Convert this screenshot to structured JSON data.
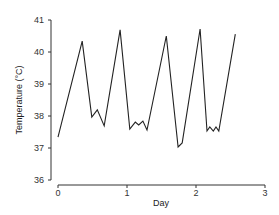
{
  "chart_data": {
    "type": "line",
    "title": "",
    "xlabel": "Day",
    "ylabel": "Temperature (°C)",
    "xlim": [
      0,
      3
    ],
    "ylim": [
      36,
      41
    ],
    "xticks": [
      "0",
      "1",
      "2",
      "3"
    ],
    "yticks": [
      "36",
      "37",
      "38",
      "39",
      "40",
      "41"
    ],
    "grid": false,
    "legend": null,
    "series": [
      {
        "name": "Temperature",
        "color": "#222222",
        "x": [
          0,
          0.35,
          0.49,
          0.57,
          0.67,
          0.9,
          1.04,
          1.12,
          1.17,
          1.23,
          1.29,
          1.57,
          1.74,
          1.8,
          2.06,
          2.16,
          2.2,
          2.25,
          2.29,
          2.33,
          2.57
        ],
        "y": [
          37.34,
          40.34,
          37.97,
          38.19,
          37.69,
          40.69,
          37.59,
          37.81,
          37.72,
          37.84,
          37.56,
          40.5,
          37.03,
          37.16,
          40.72,
          37.53,
          37.66,
          37.53,
          37.66,
          37.53,
          40.56
        ]
      }
    ]
  }
}
